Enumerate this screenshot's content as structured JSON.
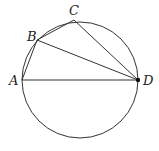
{
  "diagram": {
    "type": "circle-inscribed-quadrilateral",
    "circle": {
      "cx": 80,
      "cy": 80,
      "r": 58
    },
    "points": {
      "A": {
        "label": "A",
        "x": 22,
        "y": 80
      },
      "B": {
        "label": "B",
        "x": 37,
        "y": 40
      },
      "C": {
        "label": "C",
        "x": 74,
        "y": 20
      },
      "D": {
        "label": "D",
        "x": 138,
        "y": 80
      }
    },
    "segments": [
      "AB",
      "BC",
      "CD",
      "BD",
      "AD"
    ],
    "stroke_color": "#333333",
    "marked_point": "D"
  }
}
